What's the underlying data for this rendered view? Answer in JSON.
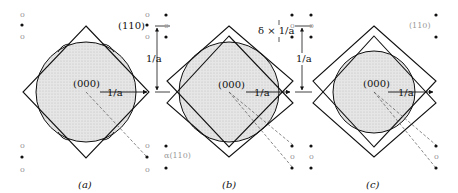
{
  "figure": {
    "panels": [
      {
        "id": "a",
        "caption": "(a)",
        "origin_label": "(000)",
        "radius_label": "1/a",
        "spacing_label": "1/a",
        "point_label": "(110)",
        "extra_label": "α(110)"
      },
      {
        "id": "b",
        "caption": "(b)",
        "origin_label": "(000)",
        "radius_label": "1/a",
        "spacing_label": "1/a",
        "shift_label": "δ × 1/a",
        "extra_label": "α(110)"
      },
      {
        "id": "c",
        "caption": "(c)",
        "origin_label": "(000)",
        "radius_label": "1/a",
        "spacing_label": "1/a",
        "extra_label": "(110)"
      }
    ],
    "colors": {
      "line": "#111111",
      "fill": "#dcdcdc",
      "faint": "#9a9a9a"
    }
  }
}
